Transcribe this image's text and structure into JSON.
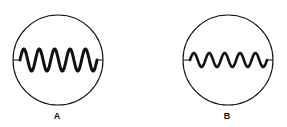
{
  "diagrams": [
    {
      "id": "A",
      "label": "A",
      "circle": {
        "cx": 58,
        "cy": 60,
        "r": 45
      },
      "wave": {
        "cycles": 5,
        "amplitude": 11,
        "x_start": 20,
        "x_end": 97,
        "stroke_width": 3
      }
    },
    {
      "id": "B",
      "label": "B",
      "circle": {
        "cx": 228,
        "cy": 60,
        "r": 45
      },
      "wave": {
        "cycles": 5,
        "amplitude": 7,
        "x_start": 190,
        "x_end": 267,
        "stroke_width": 2.6
      }
    }
  ],
  "colors": {
    "stroke": "#111111",
    "background": "#ffffff"
  }
}
